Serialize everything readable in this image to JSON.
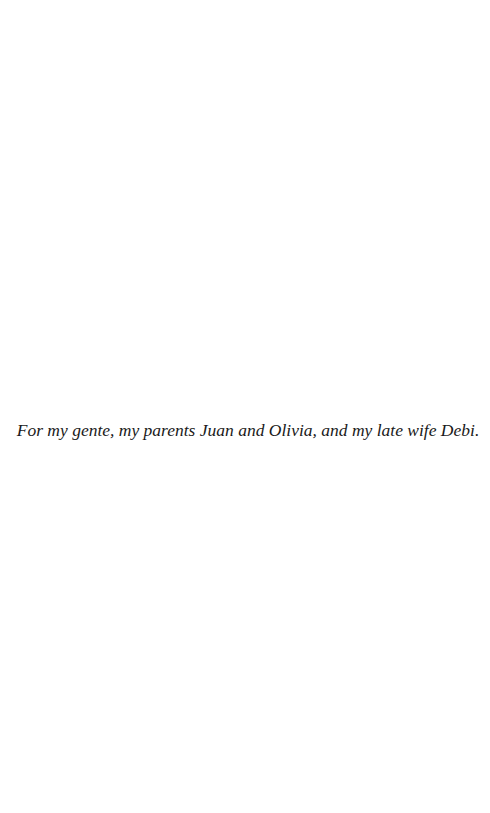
{
  "page": {
    "type": "dedication",
    "dedication_text": "For my gente, my parents Juan and Olivia, and my late wife Debi."
  }
}
